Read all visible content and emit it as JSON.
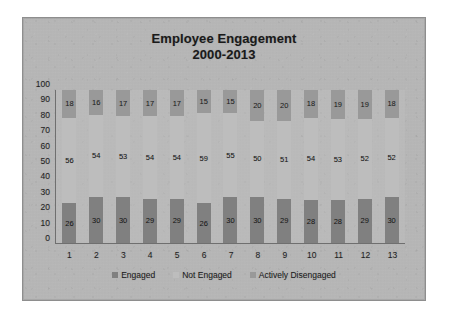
{
  "chart_data": {
    "type": "bar",
    "subtype": "stacked-bar",
    "title": "Employee Engagement",
    "subtitle": "2000-2013",
    "xlabel": "",
    "ylabel": "",
    "ylim": [
      0,
      100
    ],
    "yticks": [
      100,
      90,
      80,
      70,
      60,
      50,
      40,
      30,
      20,
      10,
      0
    ],
    "grid": false,
    "legend_position": "bottom",
    "categories": [
      "1",
      "2",
      "3",
      "4",
      "5",
      "6",
      "7",
      "8",
      "9",
      "10",
      "11",
      "12",
      "13"
    ],
    "series": [
      {
        "name": "Engaged",
        "color": "#808080",
        "values": [
          26,
          30,
          30,
          29,
          29,
          26,
          30,
          30,
          29,
          28,
          28,
          29,
          30
        ]
      },
      {
        "name": "Not Engaged",
        "color": "#bdbdbd",
        "values": [
          56,
          54,
          53,
          54,
          54,
          59,
          55,
          50,
          51,
          54,
          53,
          52,
          52
        ]
      },
      {
        "name": "Actively Disengaged",
        "color": "#999999",
        "values": [
          18,
          16,
          17,
          17,
          17,
          15,
          15,
          20,
          20,
          18,
          19,
          19,
          18
        ]
      }
    ]
  },
  "title": {
    "line1": "Employee Engagement",
    "line2": "2000-2013"
  },
  "colors": {
    "frame_background": "#b9b9b9",
    "plot_background": "#c4c4c4",
    "axis_line": "#6f6f6f",
    "engaged": "#808080",
    "not_engaged": "#bdbdbd",
    "actively_disengaged": "#999999",
    "text": "#1a1a1a"
  }
}
